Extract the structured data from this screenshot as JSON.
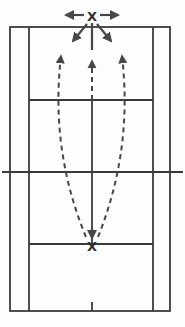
{
  "diagram": {
    "top_marker": {
      "label": "X"
    },
    "bottom_marker": {
      "label": "X"
    },
    "colors": {
      "court_line": "#3b3b3b",
      "trajectory": "#474747",
      "marker_text": "#2f2f2f",
      "background": "#fdfdfd"
    }
  }
}
